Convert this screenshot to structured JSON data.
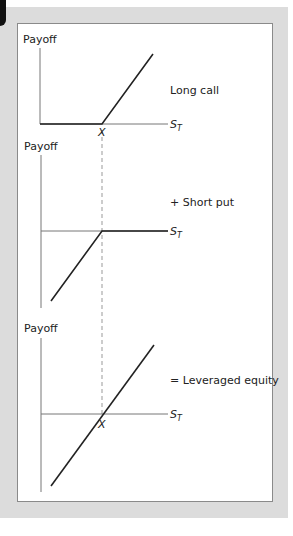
{
  "figure": {
    "panels": [
      {
        "y_label": "Payoff",
        "title": "Long call",
        "x_label": "S",
        "x_label_sub": "T",
        "strike_label": "X"
      },
      {
        "y_label": "Payoff",
        "title": "+ Short put",
        "x_label": "S",
        "x_label_sub": "T",
        "strike_label": ""
      },
      {
        "y_label": "Payoff",
        "title": "= Leveraged equity",
        "x_label": "S",
        "x_label_sub": "T",
        "strike_label": "X"
      }
    ],
    "colors": {
      "frame": "#dcdcdc",
      "line": "#222222",
      "axis": "#777777",
      "dash": "#999999"
    }
  }
}
